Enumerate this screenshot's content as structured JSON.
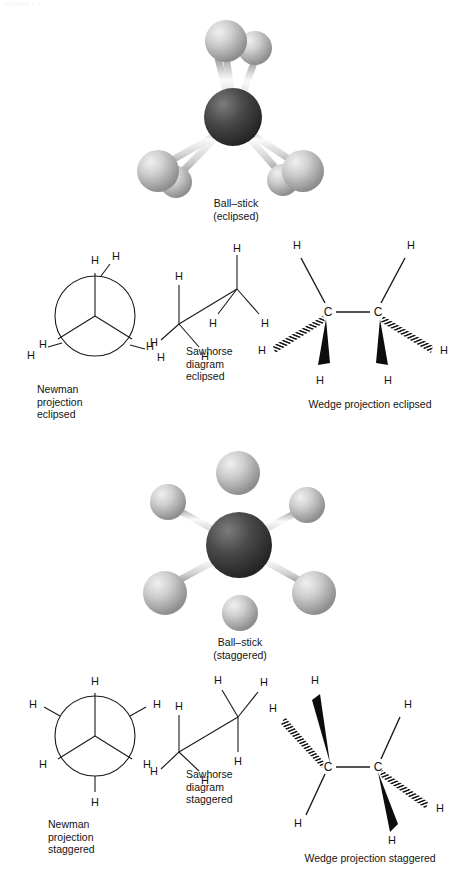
{
  "header": {
    "faint_text": "FIGURE 4.1"
  },
  "figure": {
    "atom_labels": {
      "hydrogen": "H",
      "carbon": "C"
    },
    "colors": {
      "carbon_sphere": "#3a3a3a",
      "hydrogen_sphere": "#b4b4b4",
      "bond_stick": "#e8e8e8",
      "line": "#1a1a1a",
      "background": "#ffffff"
    },
    "panels": [
      {
        "id": "ball-stick-eclipsed",
        "kind": "ball-and-stick",
        "conformation": "eclipsed",
        "caption": "Ball–stick\n(eclipsed)",
        "caption_lines": [
          "Ball–stick",
          "(eclipsed)"
        ],
        "atom_count": {
          "carbon": 2,
          "hydrogen": 6
        }
      },
      {
        "id": "newman-eclipsed",
        "kind": "newman-projection",
        "conformation": "eclipsed",
        "caption": "Newman\nprojection\neclipsed",
        "caption_lines": [
          "Newman",
          "projection",
          "eclipsed"
        ],
        "hydrogen_labels": [
          "H",
          "H",
          "H",
          "H",
          "H",
          "H"
        ],
        "dihedral_deg": 0
      },
      {
        "id": "sawhorse-eclipsed",
        "kind": "sawhorse-diagram",
        "conformation": "eclipsed",
        "caption": "Sawhorse\ndiagram\neclipsed",
        "caption_lines": [
          "Sawhorse",
          "diagram",
          "eclipsed"
        ],
        "hydrogen_labels": [
          "H",
          "H",
          "H",
          "H",
          "H",
          "H"
        ]
      },
      {
        "id": "wedge-eclipsed",
        "kind": "wedge-projection",
        "conformation": "eclipsed",
        "caption": "Wedge projection eclipsed",
        "caption_lines": [
          "Wedge projection eclipsed"
        ],
        "carbon_labels": [
          "C",
          "C"
        ],
        "hydrogen_labels": [
          "H",
          "H",
          "H",
          "H",
          "H",
          "H"
        ],
        "bond_styles": [
          "plain",
          "hashed",
          "solid-wedge"
        ]
      },
      {
        "id": "ball-stick-staggered",
        "kind": "ball-and-stick",
        "conformation": "staggered",
        "caption": "Ball–stick\n(staggered)",
        "caption_lines": [
          "Ball–stick",
          "(staggered)"
        ],
        "atom_count": {
          "carbon": 2,
          "hydrogen": 6
        }
      },
      {
        "id": "newman-staggered",
        "kind": "newman-projection",
        "conformation": "staggered",
        "caption": "Newman\nprojection\nstaggered",
        "caption_lines": [
          "Newman",
          "projection",
          "staggered"
        ],
        "hydrogen_labels": [
          "H",
          "H",
          "H",
          "H",
          "H",
          "H"
        ],
        "dihedral_deg": 60
      },
      {
        "id": "sawhorse-staggered",
        "kind": "sawhorse-diagram",
        "conformation": "staggered",
        "caption": "Sawhorse\ndiagram\nstaggered",
        "caption_lines": [
          "Sawhorse",
          "diagram",
          "staggered"
        ],
        "hydrogen_labels": [
          "H",
          "H",
          "H",
          "H",
          "H",
          "H"
        ]
      },
      {
        "id": "wedge-staggered",
        "kind": "wedge-projection",
        "conformation": "staggered",
        "caption": "Wedge projection staggered",
        "caption_lines": [
          "Wedge projection staggered"
        ],
        "carbon_labels": [
          "C",
          "C"
        ],
        "hydrogen_labels": [
          "H",
          "H",
          "H",
          "H",
          "H",
          "H"
        ],
        "bond_styles": [
          "plain",
          "hashed",
          "solid-wedge"
        ]
      }
    ]
  }
}
